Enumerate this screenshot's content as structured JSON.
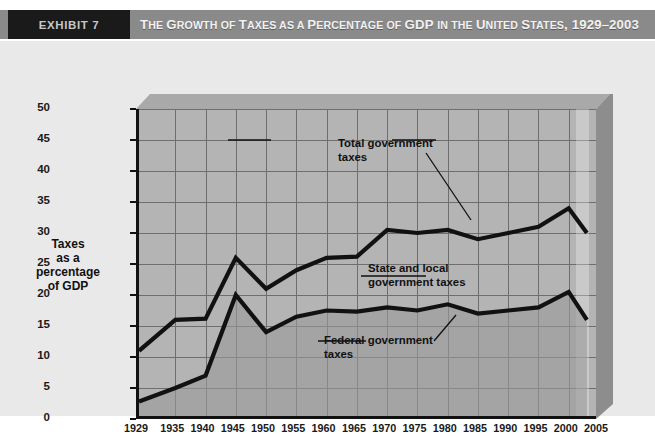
{
  "header": {
    "exhibit_label": "EXHIBIT 7",
    "title_parts": [
      {
        "text": "T",
        "size": "lg"
      },
      {
        "text": "HE ",
        "size": "sm"
      },
      {
        "text": "G",
        "size": "lg"
      },
      {
        "text": "ROWTH ",
        "size": "sm"
      },
      {
        "text": "OF ",
        "size": "sm"
      },
      {
        "text": "T",
        "size": "lg"
      },
      {
        "text": "AXES ",
        "size": "sm"
      },
      {
        "text": "AS A ",
        "size": "sm"
      },
      {
        "text": "P",
        "size": "lg"
      },
      {
        "text": "ERCENTAGE ",
        "size": "sm"
      },
      {
        "text": "OF ",
        "size": "sm"
      },
      {
        "text": "GDP ",
        "size": "lg"
      },
      {
        "text": "IN THE ",
        "size": "sm"
      },
      {
        "text": "U",
        "size": "lg"
      },
      {
        "text": "NITED ",
        "size": "sm"
      },
      {
        "text": "S",
        "size": "lg"
      },
      {
        "text": "TATES",
        "size": "sm"
      },
      {
        "text": ", 1929–2003",
        "size": "lg"
      }
    ],
    "title_plain": "The Growth of Taxes as a Percentage of GDP in the United States, 1929–2003"
  },
  "colors": {
    "band": "#8a8a8a",
    "exhibit_tag_bg": "#1a1a1a",
    "panel_bg": "#e9e9e9",
    "plot_bg": "#b4b4b4",
    "plot_fill_lower": "#9a9a9a",
    "grid": "#6e6e6e",
    "line": "#111111",
    "text": "#1a1a1a"
  },
  "chart_data": {
    "type": "line",
    "title": "The Growth of Taxes as a Percentage of GDP in the United States, 1929–2003",
    "xlabel": "Year",
    "ylabel": "Taxes as a percentage of GDP",
    "ylabel_lines": [
      "Taxes",
      "as a",
      "percentage",
      "of GDP"
    ],
    "xlim": [
      1929,
      2005
    ],
    "ylim": [
      0,
      50
    ],
    "yticks": [
      0,
      5,
      10,
      15,
      20,
      25,
      30,
      35,
      40,
      45,
      50
    ],
    "xticks": [
      1929,
      1935,
      1940,
      1945,
      1950,
      1955,
      1960,
      1965,
      1970,
      1975,
      1980,
      1985,
      1990,
      1995,
      2000,
      2005
    ],
    "grid": true,
    "legend_position": "inline-annotations",
    "x": [
      1929,
      1935,
      1940,
      1945,
      1950,
      1955,
      1960,
      1965,
      1970,
      1975,
      1980,
      1985,
      1990,
      1995,
      2000,
      2003
    ],
    "series": [
      {
        "name": "Total government taxes",
        "values": [
          11.0,
          16.0,
          16.2,
          26.0,
          21.0,
          24.0,
          26.0,
          26.2,
          30.5,
          30.0,
          30.5,
          29.0,
          30.0,
          31.0,
          34.0,
          30.0
        ]
      },
      {
        "name": "Federal government taxes",
        "values": [
          2.8,
          5.0,
          7.0,
          20.0,
          14.0,
          16.5,
          17.5,
          17.3,
          18.0,
          17.5,
          18.5,
          17.0,
          17.5,
          18.0,
          20.5,
          16.0
        ]
      }
    ],
    "annotations": [
      {
        "id": "total-government-taxes",
        "lines": [
          "Total government",
          "taxes"
        ]
      },
      {
        "id": "state-and-local-government-taxes",
        "lines": [
          "State and local",
          "government taxes"
        ]
      },
      {
        "id": "federal-government-taxes",
        "lines": [
          "Federal government",
          "taxes"
        ]
      }
    ]
  },
  "caption": {
    "text": ""
  }
}
